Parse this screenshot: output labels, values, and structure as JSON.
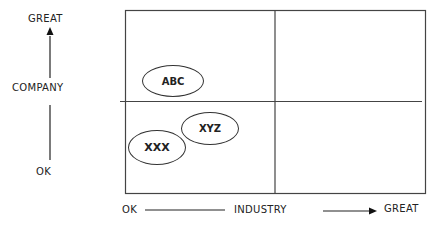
{
  "diagram": {
    "type": "2x2 positioning matrix",
    "y_axis": {
      "title": "COMPANY",
      "low": "OK",
      "high": "GREAT"
    },
    "x_axis": {
      "title": "INDUSTRY",
      "low": "OK",
      "high": "GREAT"
    },
    "items": [
      {
        "label": "ABC",
        "quadrant": "top-left"
      },
      {
        "label": "XYZ",
        "quadrant": "bottom-left"
      },
      {
        "label": "XXX",
        "quadrant": "bottom-left"
      }
    ],
    "colors": {
      "line": "#333333",
      "background": "#ffffff"
    }
  }
}
